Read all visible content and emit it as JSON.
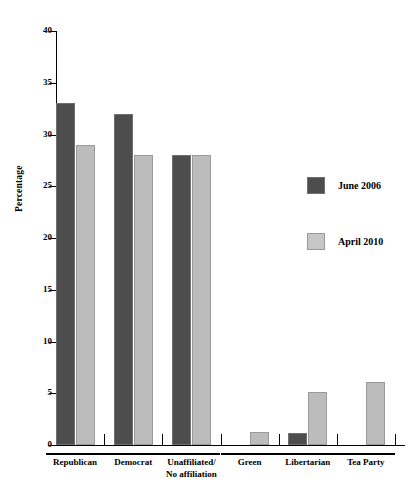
{
  "chart_data": {
    "type": "bar",
    "title": "",
    "xlabel": "",
    "ylabel": "Percentage",
    "ylim": [
      0,
      40
    ],
    "ytick_values": [
      0,
      5,
      10,
      15,
      20,
      25,
      30,
      35,
      40
    ],
    "ytick_labels": [
      "0",
      "5",
      "10",
      "15",
      "20",
      "25",
      "30",
      "35",
      "40"
    ],
    "grid": false,
    "legend_position": "right",
    "categories": [
      "Republican",
      "Democrat",
      "Unaffiliated/\nNo affiliation",
      "Green",
      "Libertarian",
      "Tea Party"
    ],
    "category_lines": [
      [
        "Republican"
      ],
      [
        "Democrat"
      ],
      [
        "Unaffiliated/",
        "No affiliation"
      ],
      [
        "Green"
      ],
      [
        "Libertarian"
      ],
      [
        "Tea Party"
      ]
    ],
    "series": [
      {
        "name": "June 2006",
        "color": "#4d4d4d",
        "values": [
          33,
          32,
          28,
          0,
          1.2,
          0
        ]
      },
      {
        "name": "April 2010",
        "color": "#bcbcbc",
        "values": [
          29,
          28,
          28,
          1.3,
          5.1,
          6.1
        ]
      }
    ]
  },
  "legend": {
    "items": [
      {
        "label": "June 2006",
        "swatch": "dark"
      },
      {
        "label": "April 2010",
        "swatch": "light"
      }
    ]
  },
  "axis": {
    "y_label": "Percentage"
  }
}
